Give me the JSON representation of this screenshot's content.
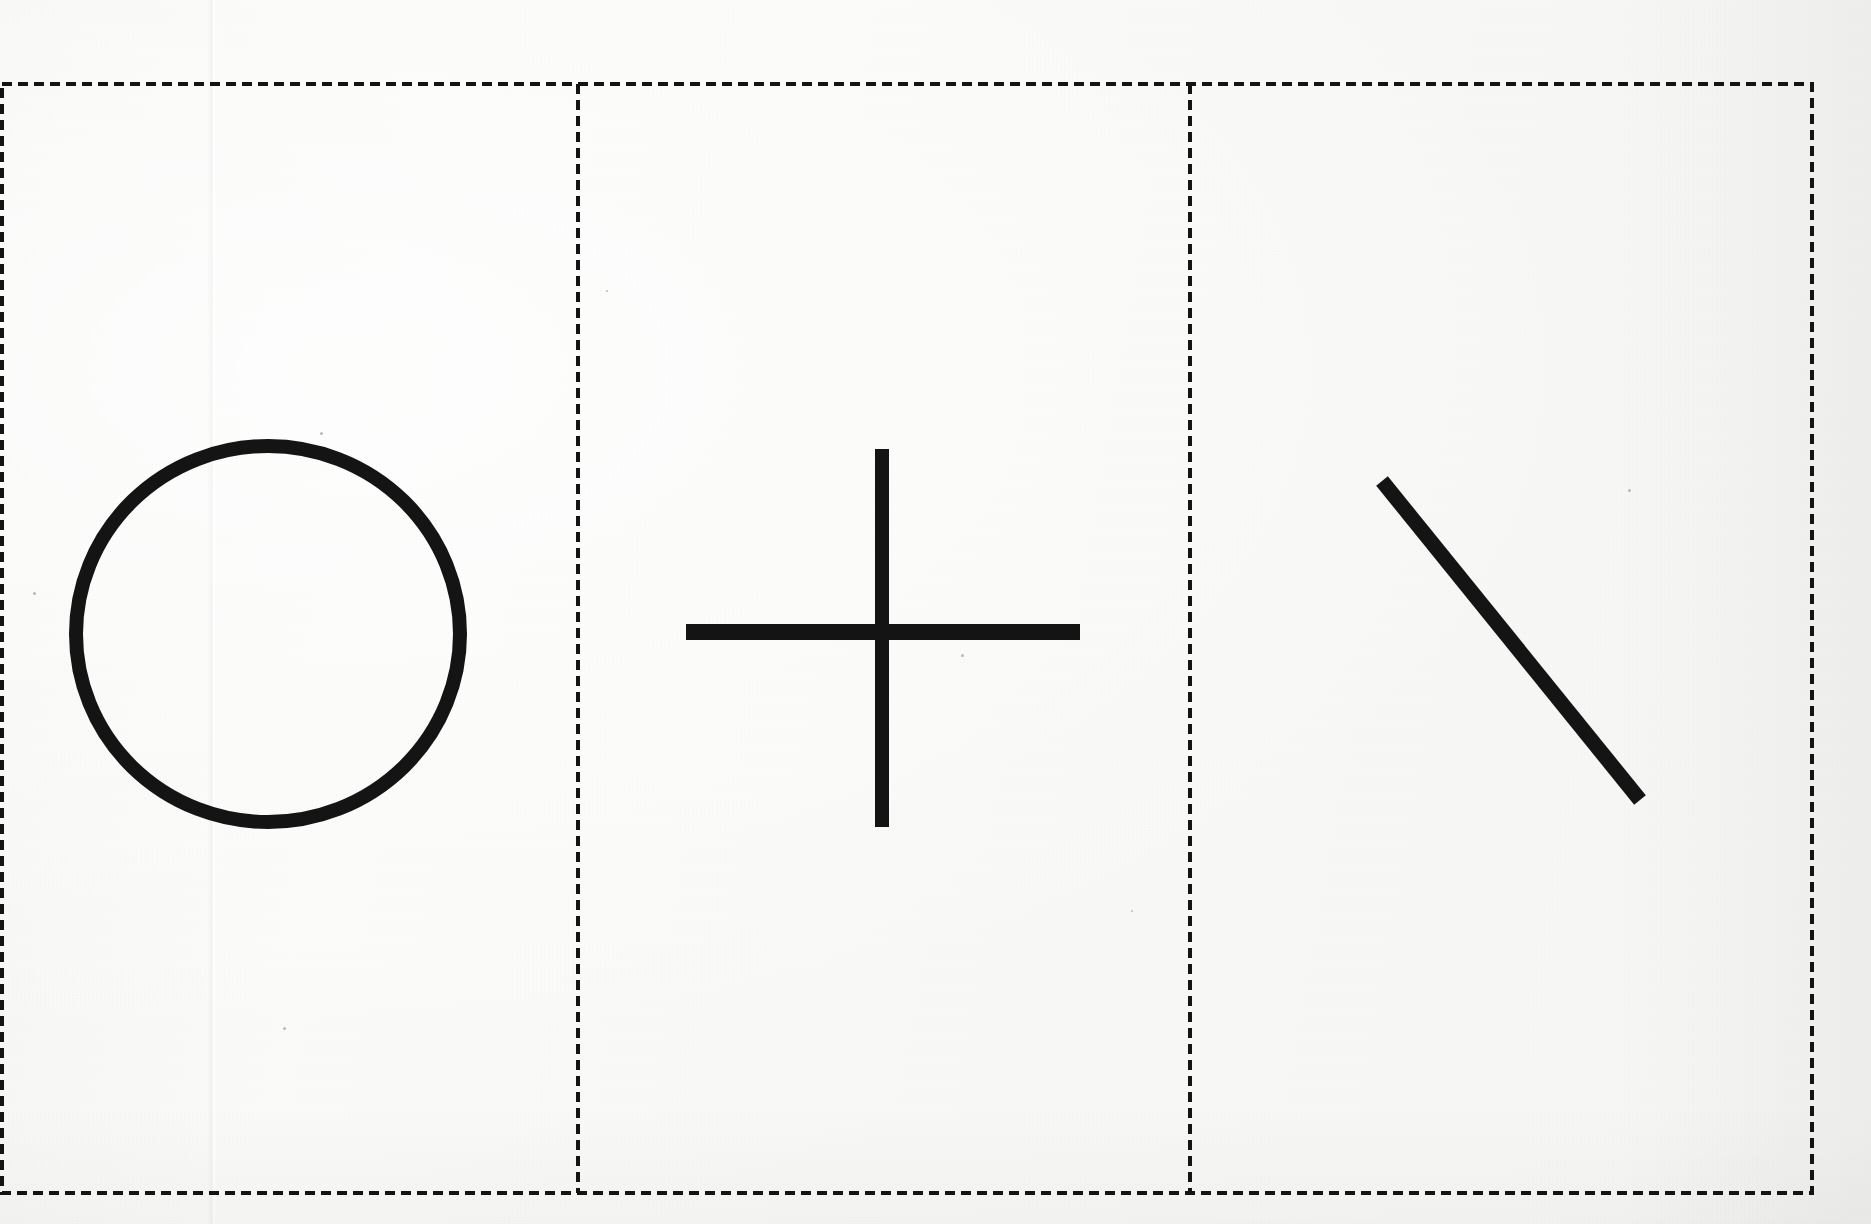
{
  "document": {
    "kind": "scanned-worksheet",
    "title": "Dashed-border card with three hand-drawn shapes",
    "width": 1871,
    "height": 1224,
    "paper_color": "#f8f8f6",
    "ink_color": "#141414"
  },
  "border": {
    "name": "dashed-card-border",
    "style": "dashed",
    "color": "#151515",
    "stroke_width": 4,
    "dash": 10,
    "gap": 6,
    "left": 2,
    "top": 84,
    "right": 1812,
    "bottom": 1193
  },
  "dividers": [
    {
      "name": "divider-1",
      "orientation": "vertical",
      "x": 578,
      "y_top": 84,
      "y_bottom": 1193,
      "style": "dashed",
      "color": "#151515",
      "stroke_width": 4
    },
    {
      "name": "divider-2",
      "orientation": "vertical",
      "x": 1190,
      "y_top": 84,
      "y_bottom": 1193,
      "style": "dashed",
      "color": "#151515",
      "stroke_width": 4
    }
  ],
  "panels": [
    {
      "index": 1,
      "name": "panel-circle",
      "x": 2,
      "width": 576,
      "shape": {
        "name": "circle-shape",
        "type": "circle",
        "cx": 268,
        "cy": 634,
        "rx": 192,
        "ry": 188,
        "stroke_width": 14,
        "filled": false,
        "color": "#141414"
      }
    },
    {
      "index": 2,
      "name": "panel-cross",
      "x": 578,
      "width": 612,
      "shape": {
        "name": "cross-shape",
        "type": "cross",
        "cx": 882,
        "cy": 632,
        "vertical": {
          "x": 882,
          "y1": 449,
          "y2": 827,
          "stroke_width": 14
        },
        "horizontal": {
          "y": 632,
          "x1": 686,
          "x2": 1080,
          "stroke_width": 16
        },
        "color": "#141414"
      }
    },
    {
      "index": 3,
      "name": "panel-diagonal",
      "x": 1190,
      "width": 622,
      "shape": {
        "name": "diagonal-line-shape",
        "type": "line",
        "x1": 1382,
        "y1": 481,
        "x2": 1640,
        "y2": 800,
        "stroke_width": 15,
        "color": "#141414"
      }
    }
  ],
  "artifacts": {
    "crease": {
      "name": "paper-crease",
      "x": 208,
      "width": 10
    },
    "specks": [
      {
        "x": 320,
        "y": 432,
        "size": 3
      },
      {
        "x": 961,
        "y": 654,
        "size": 3
      },
      {
        "x": 283,
        "y": 1027,
        "size": 3
      },
      {
        "x": 1628,
        "y": 489,
        "size": 3
      },
      {
        "x": 33,
        "y": 592,
        "size": 3
      },
      {
        "x": 1131,
        "y": 910,
        "size": 2
      },
      {
        "x": 606,
        "y": 290,
        "size": 2
      }
    ]
  }
}
